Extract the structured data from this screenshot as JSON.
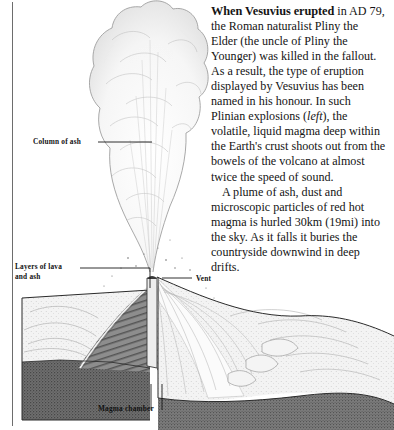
{
  "figure": {
    "name": "plinian-eruption-cross-section",
    "labels": [
      {
        "id": "column_of_ash",
        "text": "Column of ash"
      },
      {
        "id": "layers_of_lava_and_ash",
        "text": "Layers of lava and ash"
      },
      {
        "id": "vent",
        "text": "Vent"
      },
      {
        "id": "magma_chamber",
        "text": "Magma chamber"
      }
    ]
  },
  "article": {
    "heading": "When Vesuvius erupted",
    "paragraph_1_rest": " in AD 79, the Roman naturalist Pliny the Elder (the uncle of Pliny the Younger) was killed in the fallout. As a result, the type of eruption displayed by Vesuvius has been named in his honour. In such Plinian explosions (",
    "paragraph_1_italic": "left",
    "paragraph_1_tail": "), the volatile, liquid magma deep within the Earth's crust shoots out from the bowels of the volcano at almost twice the speed of sound.",
    "paragraph_2": "A plume of ash, dust and microscopic particles of red hot magma is hurled 30km (19mi) into the sky. As it falls it buries the countryside downwind in deep drifts."
  },
  "colors": {
    "ink": "#1a1a1a",
    "rule": "#6d6d6d",
    "ash_plume": "#e8e8e8",
    "inner_cone_dark": "#5e5e5e",
    "magma_chamber": "#6a6a6a",
    "outer_slope_light": "#f2f2f2",
    "ground_block": "#777777"
  }
}
